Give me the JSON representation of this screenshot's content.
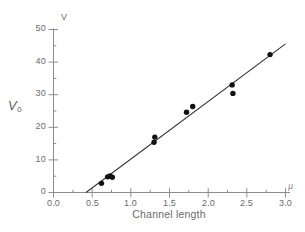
{
  "chart_data": {
    "type": "scatter",
    "title": "",
    "subtitle": "",
    "xlabel": "Channel length",
    "ylabel": "V",
    "ylabel_axis": "V0",
    "y_unit_symbol": "V",
    "x_unit_symbol": "µ",
    "xlim": [
      0.0,
      3.0
    ],
    "ylim": [
      0,
      50
    ],
    "grid": false,
    "legend": "none",
    "x_ticks": [
      0.0,
      0.5,
      1.0,
      1.5,
      2.0,
      2.5,
      3.0
    ],
    "x_tick_labels": [
      "0.0",
      "0.5",
      "1.0",
      "1.5",
      "2.0",
      "2.5",
      "3.0"
    ],
    "y_ticks": [
      0,
      10,
      20,
      30,
      40,
      50
    ],
    "y_tick_labels": [
      "0",
      "10",
      "20",
      "30",
      "40",
      "50"
    ],
    "x_minor_tick_step": 0.1,
    "y_minor_tick_step": 2.5,
    "series": [
      {
        "name": "measured",
        "marker": "filled-circle",
        "color": "#111111",
        "points": [
          [
            0.62,
            2.8
          ],
          [
            0.7,
            4.8
          ],
          [
            0.73,
            5.1
          ],
          [
            0.76,
            4.7
          ],
          [
            1.3,
            15.4
          ],
          [
            1.31,
            17.0
          ],
          [
            1.72,
            24.6
          ],
          [
            1.8,
            26.4
          ],
          [
            2.31,
            33.0
          ],
          [
            2.32,
            30.4
          ],
          [
            2.8,
            42.3
          ]
        ]
      },
      {
        "name": "linear fit",
        "marker": "none",
        "color": "#333333",
        "line_endpoints": [
          [
            0.42,
            0.0
          ],
          [
            3.0,
            45.6
          ]
        ],
        "slope": 17.67,
        "x_intercept": 0.42
      }
    ]
  },
  "axis_titles": {
    "y_top_unit": "V",
    "y_axis_label_main": "V",
    "y_axis_label_sub": "0",
    "x_axis_title": "Channel length",
    "x_end_unit": "µ"
  },
  "colors": {
    "marker": "#111111",
    "fit_line": "#333333",
    "axis": "#8d8d8d",
    "text": "#6b6b6b",
    "background": "#ffffff"
  }
}
